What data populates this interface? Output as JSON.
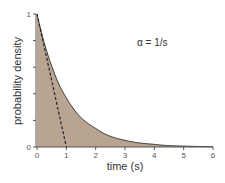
{
  "chart_data": {
    "type": "area",
    "title": "",
    "xlabel": "time (s)",
    "ylabel": "probability density",
    "xlim": [
      0,
      6
    ],
    "ylim": [
      0,
      1
    ],
    "x_ticks": [
      "0",
      "1",
      "2",
      "3",
      "4",
      "5",
      "6"
    ],
    "y_ticks": [
      "0",
      "",
      "",
      "",
      "",
      "1"
    ],
    "y_tick_values": [
      0,
      0.2,
      0.4,
      0.6,
      0.8,
      1
    ],
    "grid": false,
    "annotation": "α = 1/s",
    "series": [
      {
        "name": "exponential pdf",
        "style": "filled area",
        "color": "#b9a391",
        "x": [
          0,
          0.25,
          0.5,
          0.75,
          1,
          1.5,
          2,
          2.5,
          3,
          3.5,
          4,
          4.5,
          5,
          5.5,
          6
        ],
        "values": [
          1,
          0.78,
          0.61,
          0.47,
          0.37,
          0.22,
          0.14,
          0.08,
          0.05,
          0.03,
          0.02,
          0.01,
          0.007,
          0.004,
          0.002
        ]
      },
      {
        "name": "initial tangent",
        "style": "dashed line",
        "color": "#222222",
        "x": [
          0,
          1
        ],
        "values": [
          1,
          0
        ]
      }
    ]
  },
  "colors": {
    "fill": "#b9a391",
    "curve": "#3a3a3a",
    "axis": "#555555"
  }
}
